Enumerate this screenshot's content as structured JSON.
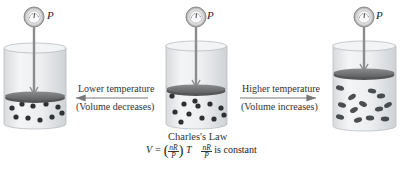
{
  "diagram": {
    "title": "Charles's Law",
    "pressure_symbol": "P",
    "transitions": {
      "left": {
        "line1": "Lower temperature",
        "line2": "(Volume decreases)",
        "direction": "left"
      },
      "right": {
        "line1": "Higher temperature",
        "line2": "(Volume increases)",
        "direction": "right"
      }
    },
    "formula": {
      "lhs": "V =",
      "frac_num": "nR",
      "frac_den": "P",
      "var": "T",
      "note_suffix": "is constant"
    },
    "containers": [
      {
        "id": "low-temp",
        "label": "Lower temperature state",
        "volume": "small",
        "molecules": "slow"
      },
      {
        "id": "initial",
        "label": "Initial state",
        "volume": "medium",
        "molecules": "moderate"
      },
      {
        "id": "high-temp",
        "label": "Higher temperature state",
        "volume": "large",
        "molecules": "fast"
      }
    ],
    "icons": {
      "gauge": "pressure-gauge-icon",
      "piston": "piston",
      "molecule": "gas-molecule"
    },
    "colors": {
      "glass": "#e6e8ea",
      "glass_edge": "#b8bcc0",
      "piston": "#7a7b7c",
      "piston_rim": "#545556",
      "rod": "#8a8c8e",
      "molecule": "#2e3134",
      "arrow": "#777777"
    }
  }
}
